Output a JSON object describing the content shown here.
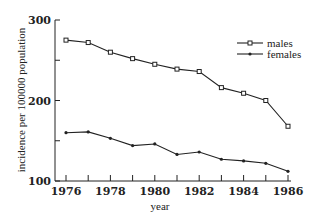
{
  "chart_data": {
    "type": "line",
    "title": "",
    "xlabel": "year",
    "ylabel": "incidence per 100000 population",
    "x": [
      1976,
      1977,
      1978,
      1979,
      1980,
      1981,
      1982,
      1983,
      1984,
      1985,
      1986
    ],
    "x_tick_labels": [
      "1976",
      "1978",
      "1980",
      "1982",
      "1984",
      "1986"
    ],
    "y_tick_labels": [
      "100",
      "200",
      "300"
    ],
    "ylim": [
      100,
      300
    ],
    "xlim": [
      1976,
      1986
    ],
    "grid": false,
    "legend_position": "upper right",
    "series": [
      {
        "name": "males",
        "marker": "square",
        "values": [
          275,
          272,
          260,
          252,
          245,
          239,
          236,
          216,
          209,
          200,
          168
        ]
      },
      {
        "name": "females",
        "marker": "dot",
        "values": [
          160,
          161,
          153,
          144,
          146,
          133,
          136,
          127,
          125,
          122,
          112
        ]
      }
    ]
  }
}
